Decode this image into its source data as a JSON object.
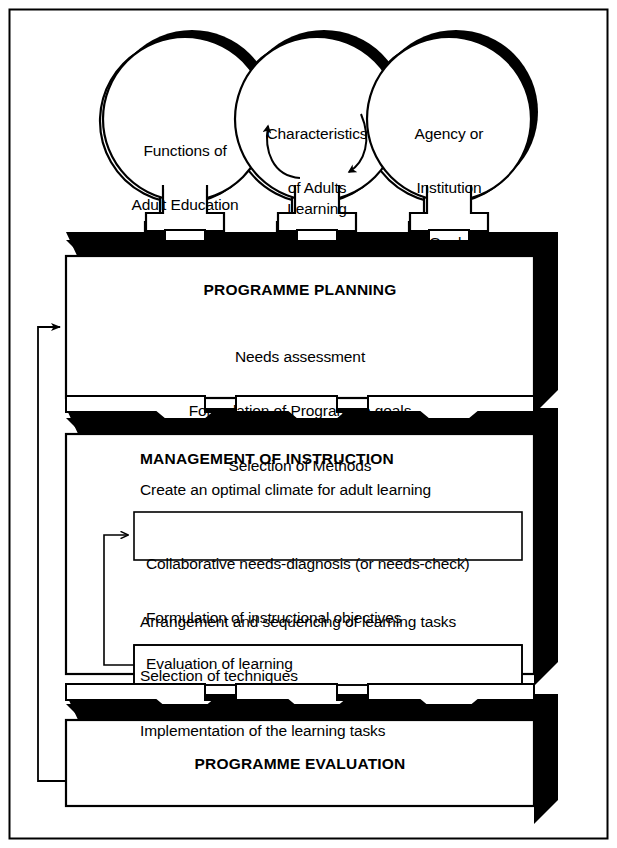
{
  "figure": {
    "frame_color": "#000000",
    "fill_color": "#ffffff",
    "shadow_color": "#000000"
  },
  "inputs": [
    {
      "id": "functions-of-adult-education",
      "lines": [
        "Functions of",
        "Adult Education"
      ],
      "shape": "circle"
    },
    {
      "id": "characteristics-of-adults-learning",
      "lines": [
        "Characteristics",
        "of Adults",
        "Learning"
      ],
      "shape": "circle",
      "has_cycle_arrows": true
    },
    {
      "id": "agency-or-institution-goals",
      "lines": [
        "Agency or",
        "Institution",
        "Goals"
      ],
      "shape": "circle"
    }
  ],
  "stages": [
    {
      "id": "programme-planning",
      "title": "PROGRAMME PLANNING",
      "align": "center",
      "lines": [
        "Needs assessment",
        "Formulation of Programme goals",
        "Selection of Methods"
      ]
    },
    {
      "id": "management-of-instruction",
      "title": "MANAGEMENT OF INSTRUCTION",
      "align": "left",
      "lines": [
        "Create an optimal climate for adult learning"
      ],
      "subboxes": [
        {
          "id": "needs-diagnosis-box",
          "lines": [
            "Collaborative needs-diagnosis (or needs-check)",
            "Formulation of instructional objectives"
          ]
        },
        {
          "id": "evaluation-of-learning-box",
          "lines": [
            "Evaluation of learning"
          ]
        }
      ],
      "middle_lines": [
        "Arrangement and sequencing of learning tasks",
        "Selection of techniques",
        "Implementation of the learning tasks"
      ]
    },
    {
      "id": "programme-evaluation",
      "title": "PROGRAMME EVALUATION",
      "align": "center",
      "lines": []
    }
  ],
  "connectors": {
    "downward_arrow_count_per_band": 3,
    "feedback_loops": [
      {
        "id": "evaluation-to-planning-feedback",
        "from": "programme-evaluation",
        "to": "programme-planning"
      },
      {
        "id": "evaluation-of-learning-to-needs-diagnosis-feedback",
        "from": "evaluation-of-learning-box",
        "to": "needs-diagnosis-box"
      }
    ]
  }
}
